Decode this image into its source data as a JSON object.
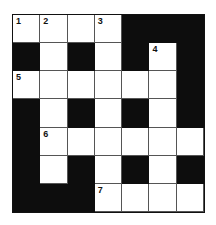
{
  "puzzle": {
    "type": "crossword",
    "rows": 7,
    "cols": 7,
    "grid": [
      [
        1,
        1,
        1,
        1,
        0,
        0,
        0
      ],
      [
        0,
        1,
        0,
        1,
        0,
        1,
        0
      ],
      [
        1,
        1,
        1,
        1,
        1,
        1,
        0
      ],
      [
        0,
        1,
        0,
        1,
        0,
        1,
        0
      ],
      [
        0,
        1,
        1,
        1,
        1,
        1,
        1
      ],
      [
        0,
        1,
        0,
        1,
        0,
        1,
        0
      ],
      [
        0,
        0,
        0,
        1,
        1,
        1,
        1
      ]
    ],
    "numbers": [
      {
        "row": 0,
        "col": 0,
        "n": "1"
      },
      {
        "row": 0,
        "col": 1,
        "n": "2"
      },
      {
        "row": 0,
        "col": 3,
        "n": "3"
      },
      {
        "row": 1,
        "col": 5,
        "n": "4"
      },
      {
        "row": 2,
        "col": 0,
        "n": "5"
      },
      {
        "row": 4,
        "col": 1,
        "n": "6"
      },
      {
        "row": 6,
        "col": 3,
        "n": "7"
      }
    ],
    "colors": {
      "black": "#0d0d0d",
      "white": "#ffffff",
      "line": "#555555"
    }
  }
}
